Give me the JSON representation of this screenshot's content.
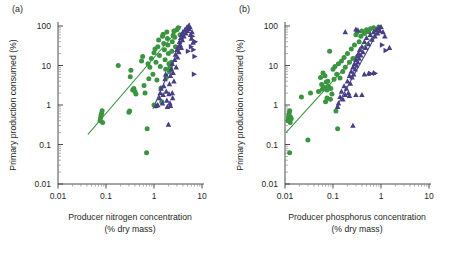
{
  "figure": {
    "panels": [
      {
        "label": "(a)",
        "xlabel_line1": "Producer nitrogen concentration",
        "xlabel_line2": "(% dry mass)",
        "ylabel": "Primary production consumed (%)"
      },
      {
        "label": "(b)",
        "xlabel_line1": "Producer phosphorus concentration",
        "xlabel_line2": "(% dry mass)",
        "ylabel": "Primary production consumed (%)"
      }
    ]
  },
  "colors": {
    "green": "#3a9440",
    "purple": "#473e85",
    "axis": "#4d4d4d",
    "text": "#1f1f1f",
    "background": "#ffffff"
  },
  "chart_data": [
    {
      "type": "scatter",
      "title": "(a)",
      "xlabel": "Producer nitrogen concentration (% dry mass)",
      "ylabel": "Primary production consumed (%)",
      "xscale": "log",
      "yscale": "log",
      "xlim": [
        0.01,
        10
      ],
      "ylim": [
        0.01,
        100
      ],
      "xticks": [
        0.01,
        0.1,
        1,
        10
      ],
      "xticklabels": [
        "0.01",
        "0.1",
        "1",
        "10"
      ],
      "yticks": [
        0.01,
        0.1,
        1,
        10,
        100
      ],
      "yticklabels": [
        "0.01",
        "0.1",
        "1",
        "10",
        "100"
      ],
      "grid": false,
      "legend": "none",
      "series": [
        {
          "name": "Aquatic (green circles)",
          "marker": "circle",
          "color": "#3a9440",
          "points": [
            [
              0.075,
              0.4
            ],
            [
              0.077,
              0.47
            ],
            [
              0.079,
              0.55
            ],
            [
              0.081,
              0.62
            ],
            [
              0.083,
              0.72
            ],
            [
              0.085,
              0.36
            ],
            [
              0.3,
              0.66
            ],
            [
              0.31,
              0.7
            ],
            [
              0.32,
              5.2
            ],
            [
              0.33,
              7.6
            ],
            [
              0.36,
              2.4
            ],
            [
              0.38,
              2.6
            ],
            [
              0.4,
              2.2
            ],
            [
              0.42,
              1.9
            ],
            [
              0.55,
              13.0
            ],
            [
              0.58,
              17.0
            ],
            [
              0.62,
              3.1
            ],
            [
              0.65,
              2.0
            ],
            [
              0.7,
              0.062
            ],
            [
              0.72,
              0.25
            ],
            [
              0.75,
              11.0
            ],
            [
              0.78,
              4.6
            ],
            [
              0.82,
              9.0
            ],
            [
              0.88,
              15.0
            ],
            [
              0.95,
              6.0
            ],
            [
              1.0,
              21.0
            ],
            [
              1.05,
              26.0
            ],
            [
              1.1,
              12.0
            ],
            [
              1.15,
              4.3
            ],
            [
              1.2,
              30.0
            ],
            [
              1.25,
              44.0
            ],
            [
              1.3,
              18.0
            ],
            [
              1.35,
              9.5
            ],
            [
              1.4,
              2.7
            ],
            [
              1.45,
              1.2
            ],
            [
              1.5,
              55.0
            ],
            [
              1.55,
              62.0
            ],
            [
              1.6,
              36.0
            ],
            [
              1.65,
              25.0
            ],
            [
              1.7,
              14.0
            ],
            [
              1.75,
              8.0
            ],
            [
              1.8,
              5.0
            ],
            [
              1.85,
              70.0
            ],
            [
              1.9,
              48.0
            ],
            [
              1.95,
              33.0
            ],
            [
              2.0,
              20.0
            ],
            [
              2.05,
              11.0
            ],
            [
              2.1,
              7.0
            ],
            [
              2.15,
              9.0
            ],
            [
              2.2,
              8.4
            ],
            [
              2.25,
              10.5
            ],
            [
              2.3,
              12.0
            ],
            [
              2.35,
              23.0
            ],
            [
              2.4,
              40.0
            ],
            [
              2.5,
              58.0
            ],
            [
              2.6,
              75.0
            ],
            [
              2.7,
              52.0
            ],
            [
              2.8,
              30.0
            ],
            [
              3.0,
              80.0
            ],
            [
              3.2,
              90.0
            ],
            [
              3.5,
              60.0
            ],
            [
              0.18,
              10.0
            ],
            [
              1.0,
              1.0
            ],
            [
              1.1,
              0.95
            ]
          ]
        },
        {
          "name": "Terrestrial (purple triangles)",
          "marker": "triangle-up",
          "color": "#473e85",
          "points": [
            [
              1.1,
              0.95
            ],
            [
              1.2,
              1.0
            ],
            [
              1.3,
              1.5
            ],
            [
              1.35,
              2.0
            ],
            [
              1.4,
              2.6
            ],
            [
              1.5,
              1.1
            ],
            [
              1.55,
              1.8
            ],
            [
              1.6,
              3.0
            ],
            [
              1.7,
              4.5
            ],
            [
              1.75,
              6.0
            ],
            [
              1.8,
              2.2
            ],
            [
              1.85,
              1.3
            ],
            [
              1.9,
              0.9
            ],
            [
              2.0,
              0.32
            ],
            [
              2.05,
              1.9
            ],
            [
              2.1,
              3.4
            ],
            [
              2.2,
              5.5
            ],
            [
              2.3,
              8.0
            ],
            [
              2.4,
              11.0
            ],
            [
              2.5,
              6.5
            ],
            [
              2.6,
              4.0
            ],
            [
              2.7,
              14.0
            ],
            [
              2.8,
              19.0
            ],
            [
              2.9,
              9.0
            ],
            [
              3.0,
              25.0
            ],
            [
              3.1,
              16.0
            ],
            [
              3.2,
              30.0
            ],
            [
              3.3,
              22.0
            ],
            [
              3.4,
              40.0
            ],
            [
              3.5,
              33.0
            ],
            [
              3.6,
              50.0
            ],
            [
              3.7,
              28.0
            ],
            [
              3.8,
              60.0
            ],
            [
              3.9,
              44.0
            ],
            [
              4.0,
              70.0
            ],
            [
              4.2,
              55.0
            ],
            [
              4.4,
              80.0
            ],
            [
              4.6,
              65.0
            ],
            [
              4.8,
              90.0
            ],
            [
              5.0,
              75.0
            ],
            [
              5.2,
              100.0
            ],
            [
              5.4,
              85.0
            ],
            [
              5.6,
              95.0
            ],
            [
              5.8,
              60.0
            ],
            [
              6.0,
              48.0
            ],
            [
              6.2,
              70.0
            ],
            [
              6.5,
              38.0
            ],
            [
              2.4,
              2.0
            ],
            [
              2.45,
              1.5
            ],
            [
              2.2,
              0.95
            ],
            [
              2.15,
              1.1
            ]
          ]
        },
        {
          "name": "Terrestrial (purple right triangles)",
          "marker": "triangle-right",
          "color": "#473e85",
          "points": [
            [
              6.8,
              6.0
            ],
            [
              7.0,
              17.0
            ],
            [
              6.6,
              25.0
            ],
            [
              7.2,
              40.0
            ],
            [
              5.9,
              30.0
            ],
            [
              6.3,
              55.0
            ],
            [
              5.1,
              23.0
            ]
          ]
        }
      ],
      "fit_lines": [
        {
          "name": "green-fit",
          "color": "#3a9440",
          "x0": 0.042,
          "y0": 0.18,
          "x1": 3.7,
          "y1": 100
        },
        {
          "name": "purple-fit",
          "color": "#473e85",
          "x0": 0.95,
          "y0": 0.8,
          "x1": 5.6,
          "y1": 120
        }
      ]
    },
    {
      "type": "scatter",
      "title": "(b)",
      "xlabel": "Producer phosphorus concentration (% dry mass)",
      "ylabel": "Primary production consumed (%)",
      "xscale": "log",
      "yscale": "log",
      "xlim": [
        0.01,
        10
      ],
      "ylim": [
        0.01,
        100
      ],
      "xticks": [
        0.01,
        0.1,
        1,
        10
      ],
      "xticklabels": [
        "0.01",
        "0.1",
        "1",
        "10"
      ],
      "yticks": [
        0.01,
        0.1,
        1,
        10,
        100
      ],
      "yticklabels": [
        "0.01",
        "0.1",
        "1",
        "10",
        "100"
      ],
      "grid": false,
      "legend": "none",
      "series": [
        {
          "name": "Aquatic (green circles)",
          "marker": "circle",
          "color": "#3a9440",
          "points": [
            [
              0.0115,
              0.4
            ],
            [
              0.0118,
              0.47
            ],
            [
              0.012,
              0.55
            ],
            [
              0.0122,
              0.62
            ],
            [
              0.0125,
              0.72
            ],
            [
              0.0128,
              0.36
            ],
            [
              0.013,
              0.5
            ],
            [
              0.0135,
              0.45
            ],
            [
              0.0125,
              0.062
            ],
            [
              0.022,
              1.6
            ],
            [
              0.03,
              0.13
            ],
            [
              0.034,
              2.0
            ],
            [
              0.05,
              2.2
            ],
            [
              0.055,
              5.0
            ],
            [
              0.058,
              3.3
            ],
            [
              0.06,
              2.5
            ],
            [
              0.062,
              6.5
            ],
            [
              0.065,
              2.8
            ],
            [
              0.068,
              5.5
            ],
            [
              0.07,
              1.2
            ],
            [
              0.072,
              3.8
            ],
            [
              0.075,
              2.4
            ],
            [
              0.078,
              4.0
            ],
            [
              0.08,
              3.0
            ],
            [
              0.085,
              23.0
            ],
            [
              0.09,
              2.6
            ],
            [
              0.095,
              1.9
            ],
            [
              0.1,
              8.0
            ],
            [
              0.105,
              4.5
            ],
            [
              0.11,
              9.5
            ],
            [
              0.115,
              0.7
            ],
            [
              0.12,
              6.0
            ],
            [
              0.125,
              0.25
            ],
            [
              0.13,
              11.0
            ],
            [
              0.14,
              4.8
            ],
            [
              0.15,
              13.0
            ],
            [
              0.16,
              7.0
            ],
            [
              0.17,
              16.0
            ],
            [
              0.18,
              9.0
            ],
            [
              0.2,
              20.0
            ],
            [
              0.22,
              12.0
            ],
            [
              0.24,
              26.0
            ],
            [
              0.26,
              15.0
            ],
            [
              0.28,
              33.0
            ],
            [
              0.3,
              60.0
            ],
            [
              0.32,
              70.0
            ],
            [
              0.35,
              40.0
            ],
            [
              0.38,
              55.0
            ],
            [
              0.4,
              75.0
            ],
            [
              0.45,
              65.0
            ],
            [
              0.5,
              80.0
            ],
            [
              0.55,
              72.0
            ],
            [
              0.6,
              85.0
            ],
            [
              0.7,
              90.0
            ],
            [
              0.8,
              78.0
            ],
            [
              0.9,
              95.0
            ],
            [
              0.075,
              1.5
            ],
            [
              0.088,
              1.4
            ]
          ]
        },
        {
          "name": "Terrestrial (purple triangles)",
          "marker": "triangle-up",
          "color": "#473e85",
          "points": [
            [
              0.125,
              0.9
            ],
            [
              0.13,
              1.1
            ],
            [
              0.14,
              1.6
            ],
            [
              0.15,
              2.2
            ],
            [
              0.16,
              1.4
            ],
            [
              0.17,
              3.0
            ],
            [
              0.18,
              1.8
            ],
            [
              0.19,
              2.6
            ],
            [
              0.2,
              4.0
            ],
            [
              0.21,
              2.0
            ],
            [
              0.22,
              5.5
            ],
            [
              0.23,
              3.5
            ],
            [
              0.24,
              7.0
            ],
            [
              0.25,
              5.0
            ],
            [
              0.26,
              9.0
            ],
            [
              0.27,
              6.0
            ],
            [
              0.28,
              11.0
            ],
            [
              0.29,
              8.0
            ],
            [
              0.3,
              14.0
            ],
            [
              0.31,
              10.0
            ],
            [
              0.32,
              17.0
            ],
            [
              0.33,
              12.0
            ],
            [
              0.34,
              20.0
            ],
            [
              0.35,
              15.0
            ],
            [
              0.36,
              25.0
            ],
            [
              0.38,
              18.0
            ],
            [
              0.4,
              30.0
            ],
            [
              0.42,
              22.0
            ],
            [
              0.45,
              40.0
            ],
            [
              0.48,
              28.0
            ],
            [
              0.5,
              50.0
            ],
            [
              0.55,
              35.0
            ],
            [
              0.6,
              60.0
            ],
            [
              0.65,
              45.0
            ],
            [
              0.7,
              70.0
            ],
            [
              0.75,
              55.0
            ],
            [
              0.8,
              80.0
            ],
            [
              0.85,
              65.0
            ],
            [
              0.9,
              90.0
            ],
            [
              0.95,
              75.0
            ],
            [
              1.0,
              95.0
            ],
            [
              1.1,
              70.0
            ],
            [
              1.2,
              55.0
            ],
            [
              1.5,
              28.0
            ],
            [
              0.26,
              0.3
            ],
            [
              0.22,
              1.7
            ],
            [
              0.3,
              1.8
            ],
            [
              0.4,
              1.8
            ],
            [
              0.45,
              6.0
            ],
            [
              0.55,
              6.2
            ],
            [
              0.7,
              6.5
            ],
            [
              0.18,
              70.0
            ],
            [
              0.3,
              82.0
            ],
            [
              0.33,
              78.0
            ]
          ]
        },
        {
          "name": "Terrestrial (purple right triangles)",
          "marker": "triangle-right",
          "color": "#473e85",
          "points": [
            [
              1.05,
              33.0
            ],
            [
              0.6,
              6.3
            ],
            [
              0.75,
              6.4
            ],
            [
              1.25,
              24.0
            ]
          ]
        }
      ],
      "fit_lines": [
        {
          "name": "green-fit",
          "color": "#3a9440",
          "x0": 0.0105,
          "y0": 0.2,
          "x1": 1.0,
          "y1": 90
        },
        {
          "name": "purple-fit",
          "color": "#473e85",
          "x0": 0.115,
          "y0": 0.85,
          "x1": 1.0,
          "y1": 100
        }
      ]
    }
  ]
}
